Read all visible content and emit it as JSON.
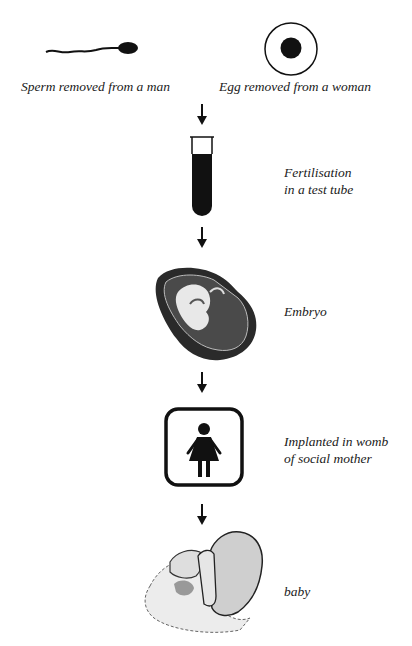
{
  "diagram": {
    "title": "",
    "type": "process-flow",
    "steps": [
      {
        "id": "sperm",
        "icon": "sperm-icon",
        "label": "Sperm removed from a man"
      },
      {
        "id": "egg",
        "icon": "egg-icon",
        "label": "Egg removed from a woman"
      },
      {
        "id": "fertilisation",
        "icon": "test-tube-icon",
        "label_line1": "Fertilisation",
        "label_line2": "in a test tube"
      },
      {
        "id": "embryo",
        "icon": "embryo-icon",
        "label": "Embryo"
      },
      {
        "id": "implantation",
        "icon": "woman-icon",
        "label_line1": "Implanted in womb",
        "label_line2": "of social mother"
      },
      {
        "id": "baby",
        "icon": "baby-icon",
        "label": "baby"
      }
    ],
    "arrows": [
      "down",
      "down",
      "down",
      "down"
    ],
    "colors": {
      "ink": "#111111",
      "background": "#ffffff",
      "baby_fill": "#d9d9d9"
    }
  }
}
